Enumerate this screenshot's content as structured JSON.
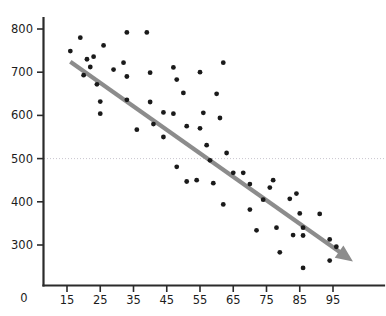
{
  "chart_data": {
    "type": "scatter",
    "title": "",
    "subtitle": "",
    "xlabel": "",
    "ylabel": "",
    "xlim": [
      10,
      100
    ],
    "ylim": [
      200,
      830
    ],
    "grid": true,
    "gridlines_y": [
      500
    ],
    "legend": null,
    "legend_position": "none",
    "origin_label": "0",
    "xticks": [
      15,
      25,
      35,
      45,
      55,
      65,
      75,
      85,
      95
    ],
    "xtick_labels": [
      "15",
      "25",
      "35",
      "45",
      "55",
      "65",
      "75",
      "85",
      "95"
    ],
    "yticks": [
      300,
      400,
      500,
      600,
      700,
      800
    ],
    "ytick_labels": [
      "300",
      "400",
      "500",
      "600",
      "700",
      "800"
    ],
    "series": [
      {
        "name": "observations",
        "marker": "circle",
        "color": "#1a1a1a",
        "points": [
          [
            16,
            749
          ],
          [
            19,
            780
          ],
          [
            21,
            730
          ],
          [
            22,
            712
          ],
          [
            23,
            736
          ],
          [
            20,
            693
          ],
          [
            24,
            672
          ],
          [
            25,
            632
          ],
          [
            25,
            604
          ],
          [
            26,
            762
          ],
          [
            29,
            706
          ],
          [
            32,
            722
          ],
          [
            33,
            690
          ],
          [
            33,
            636
          ],
          [
            36,
            567
          ],
          [
            40,
            631
          ],
          [
            41,
            580
          ],
          [
            40,
            699
          ],
          [
            39,
            792
          ],
          [
            33,
            792
          ],
          [
            44,
            607
          ],
          [
            44,
            550
          ],
          [
            47,
            604
          ],
          [
            47,
            711
          ],
          [
            48,
            683
          ],
          [
            48,
            481
          ],
          [
            51,
            575
          ],
          [
            51,
            447
          ],
          [
            50,
            652
          ],
          [
            54,
            450
          ],
          [
            55,
            570
          ],
          [
            56,
            606
          ],
          [
            57,
            531
          ],
          [
            55,
            700
          ],
          [
            58,
            496
          ],
          [
            59,
            443
          ],
          [
            60,
            650
          ],
          [
            61,
            594
          ],
          [
            62,
            722
          ],
          [
            63,
            513
          ],
          [
            62,
            394
          ],
          [
            65,
            467
          ],
          [
            68,
            467
          ],
          [
            70,
            441
          ],
          [
            70,
            382
          ],
          [
            72,
            334
          ],
          [
            74,
            405
          ],
          [
            76,
            433
          ],
          [
            77,
            450
          ],
          [
            78,
            340
          ],
          [
            79,
            283
          ],
          [
            82,
            407
          ],
          [
            83,
            323
          ],
          [
            84,
            419
          ],
          [
            85,
            373
          ],
          [
            86,
            340
          ],
          [
            86,
            322
          ],
          [
            86,
            247
          ],
          [
            91,
            372
          ],
          [
            94,
            313
          ],
          [
            94,
            264
          ],
          [
            96,
            296
          ]
        ]
      }
    ],
    "trend": {
      "type": "arrow",
      "color": "#8c8c8c",
      "direction": "negative",
      "start": [
        16,
        724
      ],
      "end": [
        101,
        262
      ]
    }
  }
}
